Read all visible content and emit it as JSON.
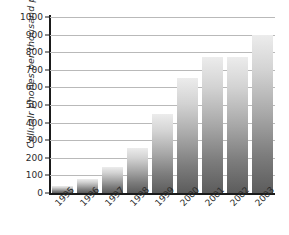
{
  "chart_data": {
    "type": "bar",
    "title": "",
    "subtitle": "",
    "xlabel": "",
    "ylabel": "Cellualr phones per thousand people",
    "categories": [
      "1995",
      "1996",
      "1997",
      "1998",
      "1999",
      "2000",
      "2001",
      "2002",
      "2003"
    ],
    "values": [
      40,
      80,
      150,
      255,
      450,
      655,
      775,
      770,
      900
    ],
    "series": [
      {
        "name": "Cellular phones per thousand people",
        "values": [
          40,
          80,
          150,
          255,
          450,
          655,
          775,
          770,
          900
        ]
      }
    ],
    "ylim": [
      0,
      1000
    ],
    "y_ticks": [
      0,
      100,
      200,
      300,
      400,
      500,
      600,
      700,
      800,
      900,
      1000
    ],
    "y_tick_labels": [
      "0",
      "100",
      "200",
      "300",
      "400",
      "500",
      "600",
      "700",
      "800",
      "900",
      "1000"
    ],
    "grid": true,
    "grid_axis": "y",
    "legend": false,
    "legend_position": "none",
    "bar_fill_top_color": "#ececec",
    "bar_fill_bottom_color": "#5c5c5c",
    "gridline_color": "#b9b9b9",
    "axis_color": "#1a1a1a",
    "background_color": "#ffffff",
    "x_label_rotation": -45,
    "annotations": []
  }
}
